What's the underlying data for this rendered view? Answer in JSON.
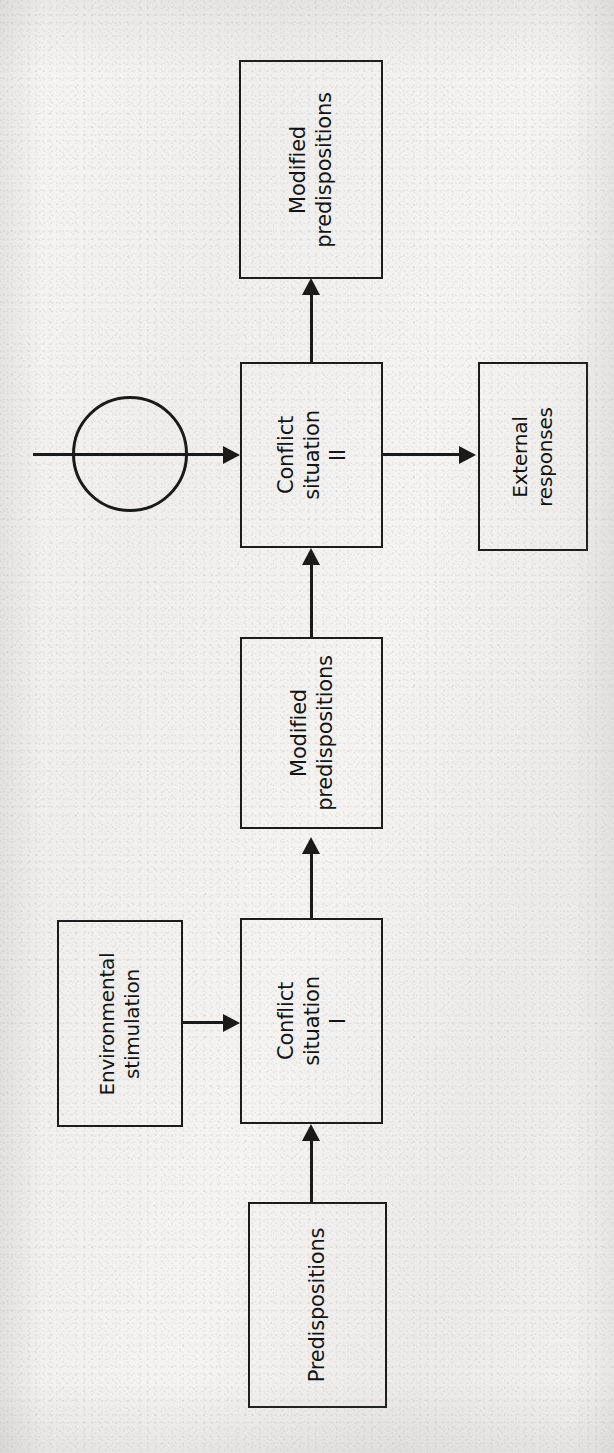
{
  "page": {
    "width": 614,
    "height": 1453,
    "orientation": "rotated-90-ccw",
    "background_color": "#f2f1ef",
    "ink_color": "#1a1a1a"
  },
  "diagram": {
    "type": "flowchart",
    "nodes": [
      {
        "id": "modified-predispositions-top",
        "label": "Modified\npredispositions",
        "shape": "rectangle",
        "x": 239,
        "y": 60,
        "w": 144,
        "h": 219
      },
      {
        "id": "conflict-situation-2",
        "label": "Conflict\nsituation\nII",
        "shape": "rectangle",
        "x": 240,
        "y": 362,
        "w": 143,
        "h": 186
      },
      {
        "id": "external-responses",
        "label": "External\nresponses",
        "shape": "rectangle",
        "x": 478,
        "y": 362,
        "w": 110,
        "h": 189
      },
      {
        "id": "modified-predispositions-mid",
        "label": "Modified\npredispositions",
        "shape": "rectangle",
        "x": 240,
        "y": 637,
        "w": 143,
        "h": 192
      },
      {
        "id": "environmental-stimulation",
        "label": "Environmental\nstimulation",
        "shape": "rectangle",
        "x": 57,
        "y": 920,
        "w": 126,
        "h": 207
      },
      {
        "id": "conflict-situation-1",
        "label": "Conflict\nsituation\nI",
        "shape": "rectangle",
        "x": 240,
        "y": 918,
        "w": 143,
        "h": 206
      },
      {
        "id": "predispositions",
        "label": "Predispositions",
        "shape": "rectangle",
        "x": 248,
        "y": 1202,
        "w": 139,
        "h": 206
      }
    ],
    "connector_circle": {
      "id": "feedback-junction",
      "cx": 130,
      "cy": 454,
      "r": 58
    },
    "edges": [
      {
        "id": "predispositions-to-conflict-1",
        "from": "predispositions",
        "to": "conflict-situation-1",
        "direction": "up"
      },
      {
        "id": "environmental-stimulation-to-conflict-1",
        "from": "environmental-stimulation",
        "to": "conflict-situation-1",
        "direction": "right"
      },
      {
        "id": "conflict-1-to-modified-predispositions-mid",
        "from": "conflict-situation-1",
        "to": "modified-predispositions-mid",
        "direction": "up"
      },
      {
        "id": "modified-predispositions-mid-to-conflict-2",
        "from": "modified-predispositions-mid",
        "to": "conflict-situation-2",
        "direction": "up"
      },
      {
        "id": "feedback-into-conflict-2",
        "from": "feedback-junction",
        "to": "conflict-situation-2",
        "direction": "right"
      },
      {
        "id": "conflict-2-to-modified-predispositions-top",
        "from": "conflict-situation-2",
        "to": "modified-predispositions-top",
        "direction": "up"
      },
      {
        "id": "conflict-2-to-external-responses",
        "from": "conflict-situation-2",
        "to": "external-responses",
        "direction": "right"
      }
    ]
  },
  "bleed_through": {
    "note": "illegible mirrored show-through text from the reverse side of the scanned page",
    "blocks": [
      {
        "id": "bleed-upper-left",
        "x": 30,
        "y": 190,
        "w": 180,
        "text": "  "
      },
      {
        "id": "bleed-right-upper",
        "x": 398,
        "y": 470,
        "w": 200,
        "text": "  "
      },
      {
        "id": "bleed-right-mid",
        "x": 398,
        "y": 620,
        "w": 200,
        "text": "  "
      },
      {
        "id": "bleed-right-lower",
        "x": 398,
        "y": 860,
        "w": 200,
        "text": "  "
      },
      {
        "id": "bleed-bottom",
        "x": 398,
        "y": 1230,
        "w": 200,
        "text": "  "
      }
    ]
  }
}
